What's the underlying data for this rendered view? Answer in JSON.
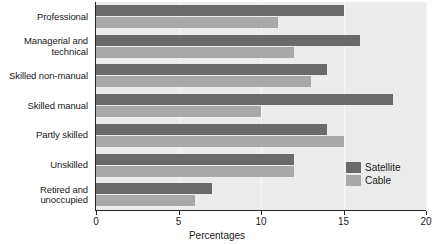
{
  "chart_data": {
    "type": "bar",
    "orientation": "horizontal",
    "title": "",
    "xlabel": "Percentages",
    "ylabel": "",
    "xlim": [
      0,
      20
    ],
    "xticks": [
      0,
      5,
      10,
      15,
      20
    ],
    "xtick_labels": [
      "0",
      "5",
      "10",
      "15",
      "20"
    ],
    "grid": true,
    "legend_position": "inside-right",
    "categories": [
      "Professional",
      "Managerial and technical",
      "Skilled non-manual",
      "Skilled manual",
      "Partly skilled",
      "Unskilled",
      "Retired and unoccupied"
    ],
    "category_lines": [
      [
        "Professional"
      ],
      [
        "Managerial and",
        "technical"
      ],
      [
        "Skilled non-manual"
      ],
      [
        "Skilled manual"
      ],
      [
        "Partly skilled"
      ],
      [
        "Unskilled"
      ],
      [
        "Retired and",
        "unoccupied"
      ]
    ],
    "series": [
      {
        "name": "Satellite",
        "color": "#6a6a6a",
        "values": [
          15,
          16,
          14,
          18,
          14,
          12,
          7
        ]
      },
      {
        "name": "Cable",
        "color": "#a9a9a9",
        "values": [
          11,
          12,
          13,
          10,
          15,
          12,
          6
        ]
      }
    ]
  },
  "legend": {
    "items": [
      {
        "label": "Satellite",
        "key": "satellite"
      },
      {
        "label": "Cable",
        "key": "cable"
      }
    ]
  },
  "colors": {
    "satellite": "#6a6a6a",
    "cable": "#a9a9a9",
    "plot_background": "#ececec",
    "axis": "#262626",
    "gridline": "#f7f7f7",
    "text": "#1a1a1a"
  }
}
